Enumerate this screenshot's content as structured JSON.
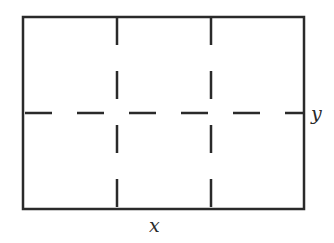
{
  "diagram": {
    "type": "rectangle-fold-lines",
    "colors": {
      "stroke": "#2a2a2a",
      "background": "#ffffff"
    },
    "rectangle": {
      "left": 23,
      "top": 17,
      "right": 304,
      "bottom": 209
    },
    "dashed_lines": {
      "vertical_x": [
        117,
        211
      ],
      "horizontal_y": [
        113
      ]
    },
    "labels": {
      "bottom": "x",
      "right": "y"
    }
  }
}
